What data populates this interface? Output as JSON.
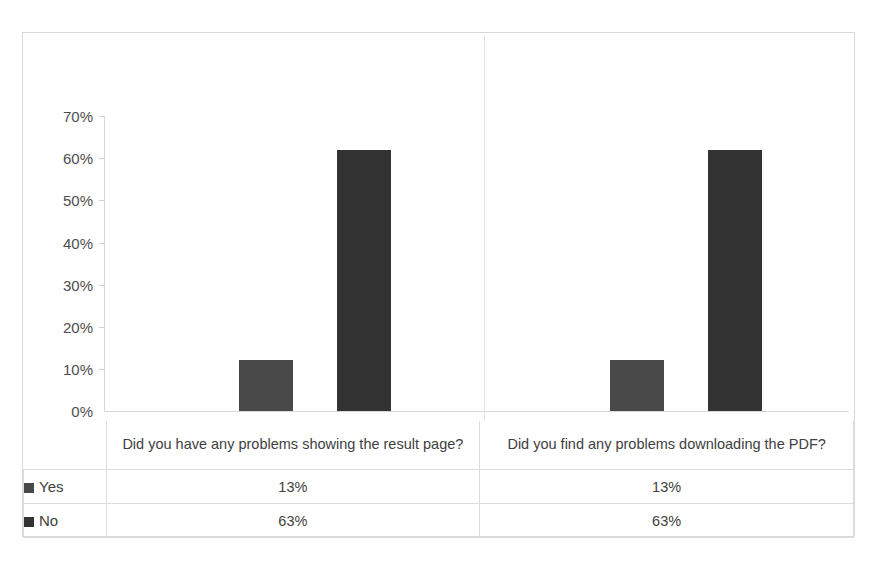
{
  "chart_data": {
    "type": "bar",
    "title": "",
    "subtitle": "",
    "xlabel": "",
    "ylabel": "",
    "ylim": [
      0,
      70
    ],
    "grid": false,
    "legend_position": "table-left",
    "axis_tick_labels": [
      "70%",
      "60%",
      "50%",
      "40%",
      "30%",
      "20%",
      "10%",
      "0%"
    ],
    "axis_tick_values": [
      70,
      60,
      50,
      40,
      30,
      20,
      10,
      0
    ],
    "categories": [
      "Did you have any problems showing the result page?",
      "Did you find any problems downloading the PDF?"
    ],
    "series": [
      {
        "name": "Yes",
        "color": "#494949",
        "values": [
          12,
          12
        ],
        "table_values": [
          "13%",
          "13%"
        ]
      },
      {
        "name": "No",
        "color": "#333333",
        "values": [
          62,
          62
        ],
        "table_values": [
          "63%",
          "63%"
        ]
      }
    ]
  },
  "colors": {
    "border": "#d9d9d9",
    "table_border": "#dcdcdc",
    "text": "#404040",
    "series_yes": "#494949",
    "series_no": "#333333"
  }
}
